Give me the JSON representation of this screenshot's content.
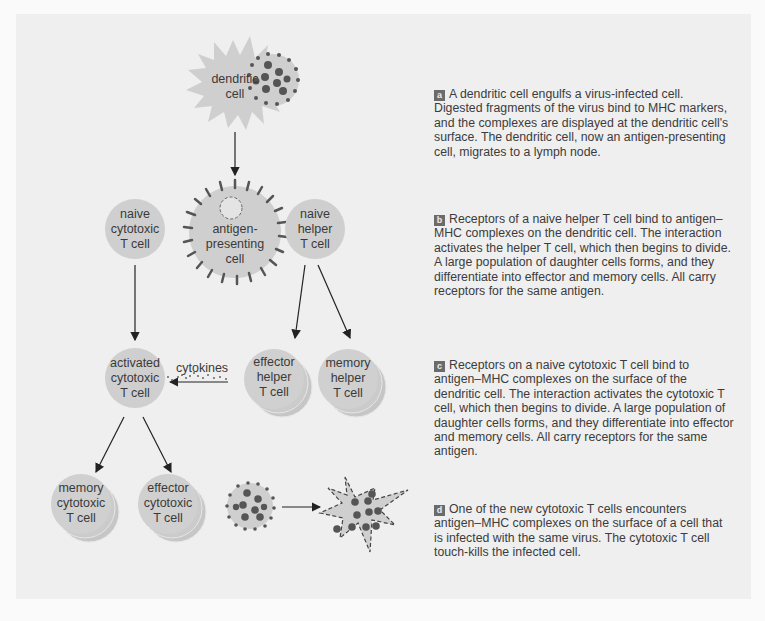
{
  "figure": {
    "cells": {
      "dendritic": "dendritic cell",
      "antigen_presenting": "antigen-presenting cell",
      "naive_cytotoxic": "naive cytotoxic T cell",
      "naive_helper": "naive helper T cell",
      "activated_cytotoxic": "activated cytotoxic T cell",
      "effector_helper": "effector helper T cell",
      "memory_helper": "memory helper T cell",
      "memory_cytotoxic": "memory cytotoxic T cell",
      "effector_cytotoxic": "effector cytotoxic T cell"
    },
    "cell_lines": {
      "dendritic": [
        "dendritic",
        "cell"
      ],
      "antigen_presenting": [
        "antigen-",
        "presenting",
        "cell"
      ],
      "naive_cytotoxic": [
        "naive",
        "cytotoxic",
        "T cell"
      ],
      "naive_helper": [
        "naive",
        "helper",
        "T cell"
      ],
      "activated_cytotoxic": [
        "activated",
        "cytotoxic",
        "T cell"
      ],
      "effector_helper": [
        "effector",
        "helper",
        "T cell"
      ],
      "memory_helper": [
        "memory",
        "helper",
        "T cell"
      ],
      "memory_cytotoxic": [
        "memory",
        "cytotoxic",
        "T cell"
      ],
      "effector_cytotoxic": [
        "effector",
        "cytotoxic",
        "T cell"
      ]
    },
    "cytokines_label": "cytokines",
    "colors": {
      "panel": "#efefef",
      "cell_fill": "#cfcfcf",
      "virus_dot": "#555555",
      "arrow": "#222222",
      "badge": "#6b6b6b"
    }
  },
  "steps": [
    {
      "letter": "a",
      "text": "A dendritic cell engulfs a virus-infected cell. Digested fragments of the virus bind to MHC markers, and the complexes are displayed at the dendritic cell's surface. The dendritic cell, now an antigen-presenting cell, migrates to a lymph node."
    },
    {
      "letter": "b",
      "text": "Receptors of a naive helper T cell bind to antigen–MHC complexes on the dendritic cell. The interaction activates the helper T cell, which then begins to divide. A large population of daughter cells forms, and they differentiate into effector and memory cells. All carry receptors for the same antigen."
    },
    {
      "letter": "c",
      "text": "Receptors on a naive cytotoxic T cell bind to antigen–MHC complexes on the surface of the dendritic cell. The interaction activates the cytotoxic T cell, which then begins to divide. A large population of daughter cells forms, and they differentiate into effector and memory cells. All carry receptors for the same antigen."
    },
    {
      "letter": "d",
      "text": "One of the new cytotoxic T cells encounters antigen–MHC complexes on the surface of a cell that is infected with the same virus. The cytotoxic T cell touch-kills the infected cell."
    }
  ]
}
